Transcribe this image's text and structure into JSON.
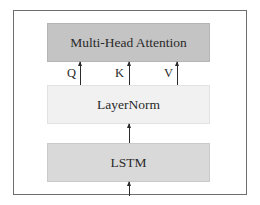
{
  "diagram": {
    "type": "architecture-block-diagram",
    "blocks": [
      {
        "id": "mha",
        "label": "Multi-Head Attention",
        "fill": "#c4c4c4"
      },
      {
        "id": "layernorm",
        "label": "LayerNorm",
        "fill": "#f1f1f1"
      },
      {
        "id": "lstm",
        "label": "LSTM",
        "fill": "#d9d9d9"
      }
    ],
    "connections": [
      {
        "from": "input",
        "to": "lstm",
        "label": ""
      },
      {
        "from": "lstm",
        "to": "layernorm",
        "label": ""
      },
      {
        "from": "layernorm",
        "to": "mha",
        "label": "Q"
      },
      {
        "from": "layernorm",
        "to": "mha",
        "label": "K"
      },
      {
        "from": "layernorm",
        "to": "mha",
        "label": "V"
      }
    ],
    "qkv_labels": {
      "q": "Q",
      "k": "K",
      "v": "V"
    },
    "frame_color": "#6e6e6e",
    "arrow_color": "#2b2b2b"
  }
}
